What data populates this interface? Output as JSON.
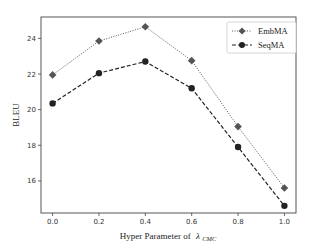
{
  "chart_data": {
    "type": "line",
    "title": "",
    "xlabel": "Hyper Parameter of",
    "xlabel_symbol": "λ",
    "xlabel_subscript": "CMC",
    "ylabel": "BLEU",
    "x": [
      0.0,
      0.2,
      0.4,
      0.6,
      0.8,
      1.0
    ],
    "x_tick_labels": [
      "0.0",
      "0.2",
      "0.4",
      "0.6",
      "0.8",
      "1.0"
    ],
    "y_ticks": [
      16,
      18,
      20,
      22,
      24
    ],
    "y_tick_labels": [
      "16",
      "18",
      "20",
      "22",
      "24"
    ],
    "xlim": [
      -0.05,
      1.05
    ],
    "ylim": [
      14.2,
      25.2
    ],
    "grid": false,
    "legend_position": "upper right",
    "series": [
      {
        "name": "EmbMA",
        "values": [
          21.95,
          23.85,
          24.65,
          22.75,
          19.05,
          15.6
        ],
        "color": "#555555",
        "marker": "diamond",
        "linestyle": "dotted"
      },
      {
        "name": "SeqMA",
        "values": [
          20.35,
          22.05,
          22.7,
          21.2,
          17.9,
          14.6
        ],
        "color": "#222222",
        "marker": "circle",
        "linestyle": "dashed"
      }
    ]
  },
  "legend": {
    "items": [
      "EmbMA",
      "SeqMA"
    ]
  }
}
